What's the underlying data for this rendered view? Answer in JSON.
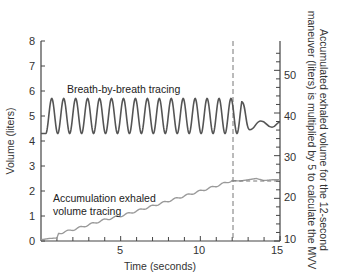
{
  "chart_data": {
    "type": "line",
    "title": "",
    "xlabel": "Time (seconds)",
    "ylabel": "Volume (liters)",
    "ylabel_right": "Accumulated exhaled volume for the 12-second maneuver (liters) is multiplied by 5 to calculate the MVV",
    "xlim": [
      0,
      15
    ],
    "ylim": [
      0,
      8
    ],
    "ylim_right": [
      10,
      55
    ],
    "x_ticks": [
      5,
      10,
      15
    ],
    "x_minor_step": 1,
    "y_ticks": [
      0,
      1,
      2,
      3,
      4,
      5,
      6,
      7,
      8
    ],
    "y_right_ticks": [
      10,
      20,
      30,
      40,
      50
    ],
    "y_right_minor_step": 2,
    "grid": false,
    "legend": null,
    "vertical_marker": {
      "x": 12,
      "style": "dashed"
    },
    "annotations": [
      {
        "text": "Breath-by-breath tracing",
        "x": 3.0,
        "y": 6.0
      },
      {
        "text": "Accumulation exhaled",
        "x": 0.8,
        "y": 1.5
      },
      {
        "text": "volume tracing",
        "x": 0.8,
        "y": 1.0
      }
    ],
    "series": [
      {
        "name": "Breath-by-breath tracing",
        "description": "Sinusoidal breathing oscillation between ~4.3 and ~5.7 L, period ~0.75 s, from 0 to ~12.6 s, then damped small oscillations around ~4.6 L",
        "color": "#555555",
        "oscillation": {
          "start": 0.3,
          "end": 12.6,
          "period": 0.75,
          "min": 4.3,
          "max": 5.7
        },
        "x": [
          0.0,
          0.25,
          12.6,
          13.1,
          13.8,
          14.5,
          15.0
        ],
        "y": [
          4.3,
          4.4,
          5.7,
          4.45,
          4.8,
          4.55,
          4.75
        ]
      },
      {
        "name": "Accumulation exhaled volume tracing",
        "color": "#9a9a9a",
        "x": [
          0,
          0.5,
          1.0,
          1.1,
          2,
          3,
          4,
          5,
          6,
          7,
          8,
          9,
          10,
          11,
          12,
          12.5,
          13,
          13.5,
          14,
          14.5,
          15
        ],
        "y": [
          0.05,
          0.1,
          0.12,
          0.3,
          0.45,
          0.65,
          0.85,
          1.0,
          1.2,
          1.4,
          1.6,
          1.8,
          2.0,
          2.2,
          2.42,
          2.4,
          2.45,
          2.5,
          2.42,
          2.45,
          2.45
        ]
      },
      {
        "name": "Accumulated volume reference (dashed)",
        "style": "dashed",
        "color": "#777777",
        "x": [
          12,
          15
        ],
        "y": [
          2.4,
          2.4
        ]
      }
    ]
  },
  "labels": {
    "xlabel": "Time (seconds)",
    "ylabel": "Volume (liters)",
    "ylabel_right_line1": "Accumulated exhaled volume for the 12-second",
    "ylabel_right_line2": "maneuver (liters) is multiplied by 5 to calculate the MVV",
    "annot_breath": "Breath-by-breath tracing",
    "annot_accum_1": "Accumulation exhaled",
    "annot_accum_2": "volume tracing",
    "x_tick_5": "5",
    "x_tick_10": "10",
    "x_tick_15": "15",
    "y_tick_0": "0",
    "y_tick_1": "1",
    "y_tick_2": "2",
    "y_tick_3": "3",
    "y_tick_4": "4",
    "y_tick_5": "5",
    "y_tick_6": "6",
    "y_tick_7": "7",
    "y_tick_8": "8",
    "yr_tick_10": "10",
    "yr_tick_20": "20",
    "yr_tick_30": "30",
    "yr_tick_40": "40",
    "yr_tick_50": "50"
  }
}
